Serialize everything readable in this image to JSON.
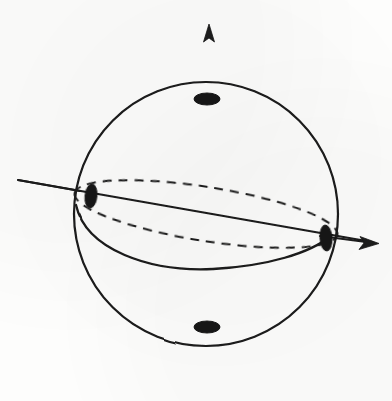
{
  "figure": {
    "kind": "sphere-with-axes",
    "background_color": "#fdfdfc",
    "ink_color": "#1a1a1a",
    "canvas": {
      "width": 392,
      "height": 401
    },
    "sphere": {
      "name": "sphere-outline",
      "center_x": 206,
      "center_y": 214,
      "radius_x": 132,
      "radius_y": 132,
      "stroke_width": 2.2,
      "stroke": "#1a1a1a",
      "fill": "none"
    },
    "equator": {
      "name": "equator-ellipse",
      "center_x": 206,
      "center_y": 214,
      "radius_x": 133,
      "radius_y": 27,
      "rotation_deg": 9,
      "back_arc_style": "dashed",
      "front_arc_style": "solid",
      "dash_pattern": "9 7",
      "stroke_width": 2.0
    },
    "axes": [
      {
        "name": "vertical-axis",
        "label": "z",
        "x1": 209,
        "y1": 385,
        "x2": 209,
        "y2": 24,
        "arrow_at": "end",
        "style_inside_sphere": "dashed",
        "style_outside_sphere": "solid",
        "dash_pattern": "9 8",
        "stroke_width": 2.0
      },
      {
        "name": "horizontal-axis",
        "label": "y",
        "x1": 18,
        "y1": 180,
        "x2": 378,
        "y2": 243,
        "arrow_at": "end",
        "style": "solid",
        "stroke_width": 1.9
      }
    ],
    "points": [
      {
        "name": "north-pole-point",
        "x": 207,
        "y": 99,
        "rx": 13,
        "ry": 6,
        "rotation_deg": 0,
        "fill": "#161616"
      },
      {
        "name": "south-pole-point",
        "x": 207,
        "y": 327,
        "rx": 13,
        "ry": 6,
        "rotation_deg": 0,
        "fill": "#161616"
      },
      {
        "name": "left-equator-point",
        "x": 91,
        "y": 196,
        "rx": 6,
        "ry": 12,
        "rotation_deg": 6,
        "fill": "#161616"
      },
      {
        "name": "right-equator-point",
        "x": 326,
        "y": 238,
        "rx": 6,
        "ry": 13,
        "rotation_deg": -4,
        "fill": "#161616"
      }
    ],
    "arrowheads": [
      {
        "name": "vertical-axis-arrowhead",
        "tip_x": 209,
        "tip_y": 24,
        "direction": "up"
      },
      {
        "name": "horizontal-axis-arrowhead",
        "tip_x": 378,
        "tip_y": 243,
        "direction": "right"
      }
    ]
  }
}
